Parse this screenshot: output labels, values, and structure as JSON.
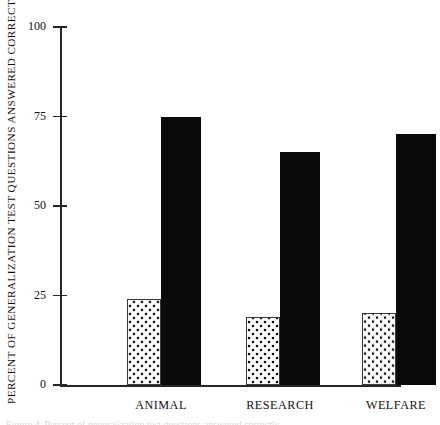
{
  "chart_data": {
    "type": "bar",
    "title": "",
    "xlabel": "",
    "ylabel": "PERCENT OF GENERALIZATION TEST QUESTIONS ANSWERED CORRECTLY",
    "ylim": [
      0,
      100
    ],
    "yticks": [
      0,
      25,
      50,
      75,
      100
    ],
    "ytick_labels": [
      "0",
      "25",
      "50",
      "75",
      "100"
    ],
    "grid": false,
    "legend": "none",
    "categories": [
      "ANIMAL",
      "RESEARCH",
      "WELFARE"
    ],
    "series": [
      {
        "name": "pretest",
        "style": "dotted",
        "color": "#ffffff",
        "values": [
          24,
          19,
          20
        ]
      },
      {
        "name": "posttest",
        "style": "solid",
        "color": "#0a0a0a",
        "values": [
          75,
          65,
          70
        ]
      }
    ]
  },
  "axis": {
    "y_title": "PERCENT OF GENERALIZATION TEST QUESTIONS ANSWERED CORRECTLY",
    "tick_0": "0",
    "tick_25": "25",
    "tick_50": "50",
    "tick_75": "75",
    "tick_100": "100"
  },
  "categories": {
    "c0": "ANIMAL",
    "c1": "RESEARCH",
    "c2": "WELFARE"
  },
  "caption_sliver": "Figure 4.  Percent of generalization test questions answered correctly"
}
